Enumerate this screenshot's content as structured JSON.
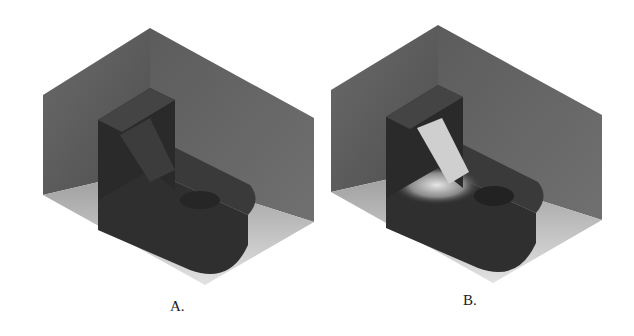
{
  "figure": {
    "panels": [
      {
        "id": "A",
        "label": "A.",
        "description": "Isometric render of L-shaped bracket in corner box, uniform dark shading"
      },
      {
        "id": "B",
        "label": "B.",
        "description": "Isometric render of L-shaped bracket in corner box, with bright highlight on rib/base"
      }
    ]
  },
  "colors": {
    "wall": "#5a5a5a",
    "floor": "#b4b4b4",
    "part": "#2e2e2e",
    "highlight": "#d8d8d8"
  }
}
